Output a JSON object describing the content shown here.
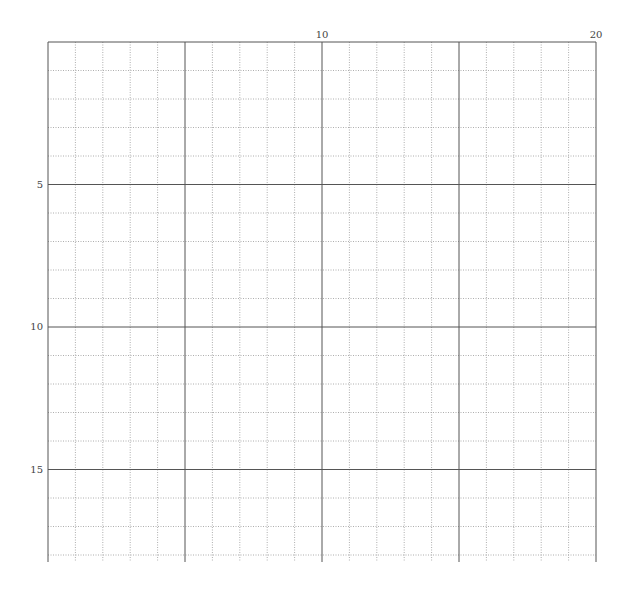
{
  "grid": {
    "columns": 20,
    "rows": 18,
    "left": 48,
    "top": 42,
    "right": 596,
    "row_height": 28.5,
    "bottom_extent": 562,
    "major_every": 5,
    "line_color_major": "#555555",
    "line_color_minor": "#999999"
  },
  "top_labels": [
    {
      "value": "10",
      "col": 10
    },
    {
      "value": "20",
      "col": 20
    }
  ],
  "left_labels": [
    {
      "value": "5",
      "row": 5
    },
    {
      "value": "10",
      "row": 10
    },
    {
      "value": "15",
      "row": 15
    }
  ]
}
